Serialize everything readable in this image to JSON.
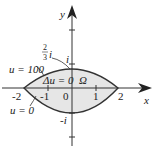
{
  "diagram": {
    "axes": {
      "x_label": "x",
      "y_label": "y",
      "x_ticks": [
        "-2",
        "-1",
        "0",
        "1",
        "2"
      ],
      "y_ticks": [
        "i",
        "-i"
      ]
    },
    "region": {
      "name": "Ω",
      "equation": "Δu = 0",
      "fill": "#e6e6e6",
      "stroke": "#333333"
    },
    "boundary_labels": {
      "upper": "u = 100",
      "lower": "u = 0",
      "upper_point_num": "2",
      "upper_point_den": "3",
      "upper_point_i": "i"
    },
    "colors": {
      "axis": "#333333",
      "text": "#222222"
    }
  }
}
